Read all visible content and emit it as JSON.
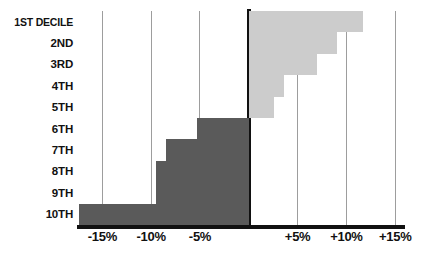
{
  "chart_data": {
    "type": "bar",
    "orientation": "horizontal",
    "title": "",
    "xlabel": "",
    "ylabel": "",
    "categories": [
      "1ST DECILE",
      "2ND",
      "3RD",
      "4TH",
      "5TH",
      "6TH",
      "7TH",
      "8TH",
      "9TH",
      "10TH"
    ],
    "values": [
      11.7,
      9.0,
      7.0,
      3.6,
      2.6,
      -5.3,
      -8.5,
      -9.5,
      -9.5,
      -17.4
    ],
    "xlim": [
      -17.4,
      15.0
    ],
    "x_ticks": [
      -15,
      -10,
      -5,
      5,
      10,
      15
    ],
    "x_tick_labels": [
      "-15%",
      "-10%",
      "-5%",
      "+5%",
      "+10%",
      "+15%"
    ],
    "grid": "vertical",
    "zero_axis": 0,
    "legend": "none",
    "colors": {
      "negative": "#5a5a5a",
      "positive": "#cccccc",
      "axis": "#111111",
      "gridline": "#9d9d9d",
      "background": "#ffffff"
    }
  }
}
